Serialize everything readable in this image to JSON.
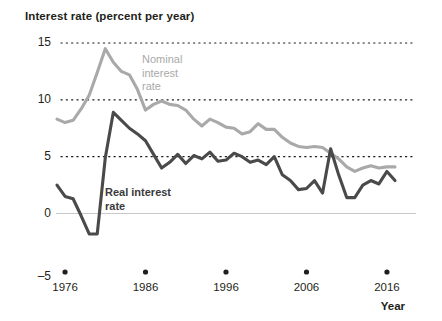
{
  "chart_data": {
    "type": "line",
    "title": "Interest rate (percent per year)",
    "xlabel": "Year",
    "ylabel": "Interest rate (percent per year)",
    "xlim": [
      1975,
      2017
    ],
    "ylim": [
      -5,
      15
    ],
    "yticks": [
      -5,
      0,
      5,
      10,
      15
    ],
    "ytick_labels": [
      "–5",
      "0",
      "5",
      "10",
      "15"
    ],
    "xticks": [
      1976,
      1986,
      1996,
      2006,
      2016
    ],
    "xtick_labels": [
      "1976",
      "1986",
      "1996",
      "2006",
      "2016"
    ],
    "grid": "dotted horizontal gridlines at 5, 10, 15; solid light line at 0",
    "legend_position": "inline annotations",
    "x": [
      1975,
      1976,
      1977,
      1978,
      1979,
      1980,
      1981,
      1982,
      1983,
      1984,
      1985,
      1986,
      1987,
      1988,
      1989,
      1990,
      1991,
      1992,
      1993,
      1994,
      1995,
      1996,
      1997,
      1998,
      1999,
      2000,
      2001,
      2002,
      2003,
      2004,
      2005,
      2006,
      2007,
      2008,
      2009,
      2010,
      2011,
      2012,
      2013,
      2014,
      2015,
      2016,
      2017
    ],
    "series": [
      {
        "name": "Nominal interest rate",
        "color": "#a9a9a9",
        "label_lines": [
          "Nominal",
          "interest",
          "rate"
        ],
        "values": [
          8.3,
          8.0,
          8.2,
          9.2,
          10.4,
          12.4,
          14.5,
          13.3,
          12.5,
          12.2,
          10.9,
          9.1,
          9.6,
          9.9,
          9.6,
          9.5,
          9.1,
          8.3,
          7.7,
          8.3,
          8.0,
          7.6,
          7.5,
          7.0,
          7.2,
          7.9,
          7.4,
          7.4,
          6.7,
          6.2,
          5.9,
          5.8,
          5.9,
          5.8,
          5.3,
          4.8,
          4.1,
          3.7,
          4.0,
          4.2,
          4.0,
          4.1,
          4.1
        ],
        "units": "percent per year"
      },
      {
        "name": "Real interest rate",
        "color": "#4a4a4a",
        "label_lines": [
          "Real interest",
          "rate"
        ],
        "values": [
          2.5,
          1.5,
          1.3,
          -0.2,
          -1.8,
          -1.8,
          4.9,
          8.9,
          8.2,
          7.5,
          7.0,
          6.4,
          5.2,
          4.0,
          4.5,
          5.2,
          4.4,
          5.1,
          4.8,
          5.4,
          4.6,
          4.7,
          5.3,
          5.0,
          4.5,
          4.7,
          4.3,
          5.0,
          3.4,
          2.9,
          2.1,
          2.2,
          2.9,
          1.8,
          5.7,
          3.4,
          1.4,
          1.4,
          2.5,
          2.9,
          2.6,
          3.7,
          2.9
        ],
        "units": "percent per year"
      }
    ]
  },
  "axis": {
    "title": "Interest rate (percent per year)",
    "x_name": "Year"
  }
}
